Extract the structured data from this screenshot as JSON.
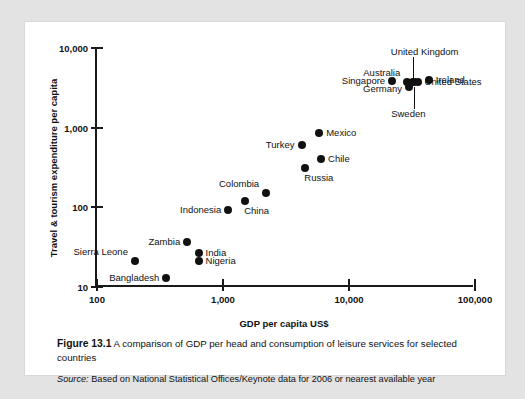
{
  "figure": {
    "number_label": "Figure 13.1",
    "caption": "A comparison of GDP per head and consumption of leisure services for selected countries",
    "source_label": "Source:",
    "source_text": "Based on National Statistical Offices/Keynote data for 2006 or nearest available year"
  },
  "chart_data": {
    "type": "scatter",
    "title": "",
    "xlabel": "GDP per capita US$",
    "ylabel": "Travel & tourism expenditure per capita",
    "xscale": "log",
    "yscale": "log",
    "xlim": [
      100,
      100000
    ],
    "ylim": [
      10,
      10000
    ],
    "xticks": [
      100,
      1000,
      10000,
      100000
    ],
    "xticklabels": [
      "100",
      "1,000",
      "10,000",
      "100,000"
    ],
    "yticks": [
      10,
      100,
      1000,
      10000
    ],
    "yticklabels": [
      "10",
      "100",
      "1,000",
      "10,000"
    ],
    "grid": false,
    "legend": false,
    "marker_color": "#111111",
    "points": [
      {
        "name": "Bangladesh",
        "x": 355,
        "y": 13,
        "label_side": "left"
      },
      {
        "name": "Sierra Leone",
        "x": 200,
        "y": 21,
        "label_side": "above-left"
      },
      {
        "name": "Nigeria",
        "x": 640,
        "y": 21,
        "label_side": "right"
      },
      {
        "name": "India",
        "x": 640,
        "y": 27,
        "label_side": "right"
      },
      {
        "name": "Zambia",
        "x": 520,
        "y": 37,
        "label_side": "left"
      },
      {
        "name": "Indonesia",
        "x": 1100,
        "y": 92,
        "label_side": "left"
      },
      {
        "name": "China",
        "x": 1500,
        "y": 120,
        "label_side": "below-right"
      },
      {
        "name": "Colombia",
        "x": 2200,
        "y": 150,
        "label_side": "above-left"
      },
      {
        "name": "Russia",
        "x": 4500,
        "y": 310,
        "label_side": "below-right"
      },
      {
        "name": "Chile",
        "x": 6000,
        "y": 400,
        "label_side": "right"
      },
      {
        "name": "Turkey",
        "x": 4200,
        "y": 600,
        "label_side": "left"
      },
      {
        "name": "Mexico",
        "x": 5800,
        "y": 850,
        "label_side": "right"
      },
      {
        "name": "Singapore",
        "x": 22000,
        "y": 3800,
        "label_side": "left"
      },
      {
        "name": "Germany",
        "x": 30000,
        "y": 3200,
        "label_side": "below-left"
      },
      {
        "name": "Australia",
        "x": 29000,
        "y": 3700,
        "label_side": "above-left"
      },
      {
        "name": "United Kingdom",
        "x": 32000,
        "y": 3750,
        "label_side": "above"
      },
      {
        "name": "Sweden",
        "x": 33000,
        "y": 3700,
        "label_side": "below"
      },
      {
        "name": "United States",
        "x": 35000,
        "y": 3700,
        "label_side": "right"
      },
      {
        "name": "Ireland",
        "x": 43000,
        "y": 4000,
        "label_side": "right"
      }
    ]
  }
}
